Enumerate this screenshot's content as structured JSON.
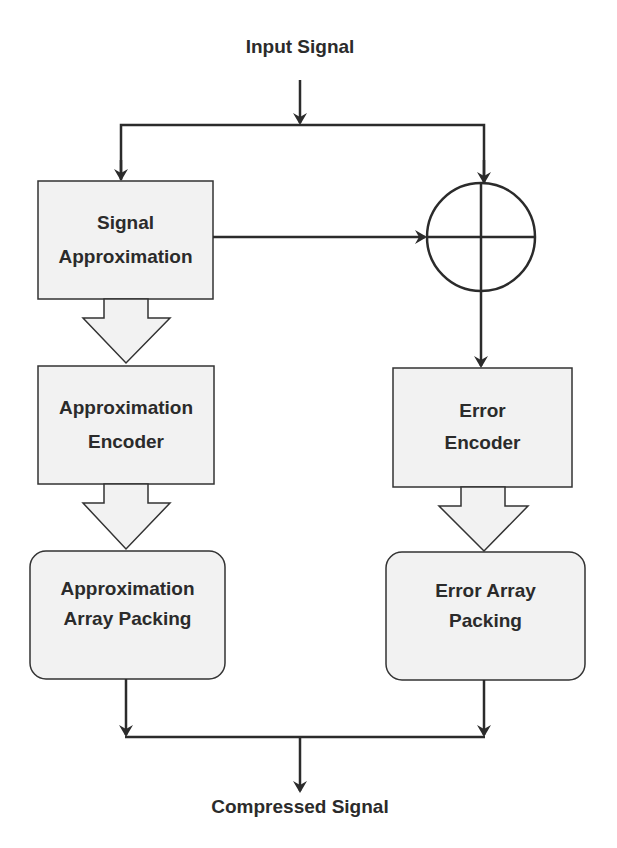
{
  "diagram": {
    "input_label": "Input Signal",
    "output_label": "Compressed Signal",
    "nodes": {
      "signal_approximation": {
        "line1": "Signal",
        "line2": "Approximation"
      },
      "approximation_encoder": {
        "line1": "Approximation",
        "line2": "Encoder"
      },
      "approximation_array_packing": {
        "line1": "Approximation",
        "line2": "Array Packing"
      },
      "error_encoder": {
        "line1": "Error",
        "line2": "Encoder"
      },
      "error_array_packing": {
        "line1": "Error Array",
        "line2": "Packing"
      },
      "summing_junction": {
        "symbol": "summing-junction"
      }
    },
    "edges": [
      {
        "from": "input",
        "to": "signal_approximation"
      },
      {
        "from": "input",
        "to": "summing_junction"
      },
      {
        "from": "signal_approximation",
        "to": "summing_junction"
      },
      {
        "from": "signal_approximation",
        "to": "approximation_encoder",
        "style": "block-arrow"
      },
      {
        "from": "approximation_encoder",
        "to": "approximation_array_packing",
        "style": "block-arrow"
      },
      {
        "from": "summing_junction",
        "to": "error_encoder"
      },
      {
        "from": "error_encoder",
        "to": "error_array_packing",
        "style": "block-arrow"
      },
      {
        "from": "approximation_array_packing",
        "to": "output"
      },
      {
        "from": "error_array_packing",
        "to": "output"
      }
    ],
    "colors": {
      "box_fill": "#f2f2f2",
      "stroke": "#333333",
      "text": "#2b2b2b"
    }
  }
}
